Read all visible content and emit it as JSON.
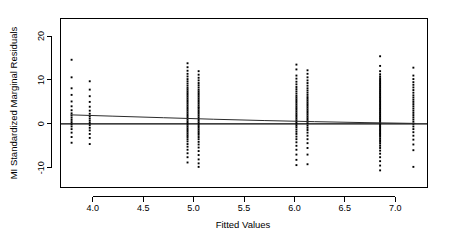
{
  "chart_data": {
    "type": "scatter",
    "title": "",
    "xlabel": "Fitted Values",
    "ylabel": "MI Standardized Marginal Residuals",
    "xlim": [
      3.68,
      7.32
    ],
    "ylim": [
      -14.5,
      24.0
    ],
    "xticks": [
      4.0,
      4.5,
      5.0,
      5.5,
      6.0,
      6.5,
      7.0
    ],
    "xtick_labels": [
      "4.0",
      "4.5",
      "5.0",
      "5.5",
      "6.0",
      "6.5",
      "7.0"
    ],
    "yticks": [
      -10,
      0,
      10,
      20
    ],
    "ytick_labels": [
      "-10",
      "0",
      "10",
      "20"
    ],
    "grid": false,
    "legend": "none",
    "point_marker": "filled-square",
    "point_color": "#000000",
    "clusters": [
      {
        "name": "cluster-3.79",
        "x": 3.79,
        "n": 18,
        "y_values": [
          14.6,
          10.6,
          8.1,
          6.6,
          5.1,
          4.0,
          3.1,
          2.4,
          1.9,
          1.4,
          0.9,
          0.4,
          -0.1,
          -0.6,
          -1.2,
          -2.0,
          -3.0,
          -4.3
        ]
      },
      {
        "name": "cluster-3.97",
        "x": 3.97,
        "n": 17,
        "y_values": [
          9.7,
          7.8,
          6.3,
          5.0,
          3.9,
          3.0,
          2.3,
          1.7,
          1.2,
          0.7,
          0.2,
          -0.3,
          -0.9,
          -1.5,
          -2.3,
          -3.2,
          -4.6
        ]
      },
      {
        "name": "cluster-4.94",
        "x": 4.94,
        "n": 46,
        "y_values": [
          13.8,
          12.9,
          12.1,
          11.4,
          10.8,
          10.2,
          9.7,
          9.2,
          8.7,
          8.2,
          7.8,
          7.4,
          7.0,
          6.6,
          6.2,
          5.8,
          5.4,
          5.0,
          4.6,
          4.2,
          3.8,
          3.4,
          3.0,
          2.6,
          2.2,
          1.8,
          1.4,
          1.0,
          0.6,
          0.2,
          -0.2,
          -0.6,
          -1.0,
          -1.4,
          -1.8,
          -2.2,
          -2.6,
          -3.0,
          -3.5,
          -4.0,
          -4.6,
          -5.2,
          -5.9,
          -6.7,
          -7.6,
          -8.8
        ]
      },
      {
        "name": "cluster-5.05",
        "x": 5.05,
        "n": 44,
        "y_values": [
          12.0,
          11.2,
          10.5,
          9.9,
          9.3,
          8.8,
          8.3,
          7.8,
          7.4,
          7.0,
          6.6,
          6.2,
          5.8,
          5.4,
          5.0,
          4.6,
          4.2,
          3.8,
          3.5,
          3.1,
          2.7,
          2.3,
          1.9,
          1.5,
          1.1,
          0.7,
          0.3,
          -0.1,
          -0.5,
          -0.9,
          -1.3,
          -1.7,
          -2.1,
          -2.5,
          -3.0,
          -3.5,
          -4.1,
          -4.7,
          -5.4,
          -6.2,
          -7.1,
          -8.1,
          -9.0,
          -9.8
        ]
      },
      {
        "name": "cluster-6.02",
        "x": 6.02,
        "n": 40,
        "y_values": [
          13.5,
          12.4,
          11.0,
          10.3,
          9.6,
          9.0,
          8.4,
          7.9,
          7.4,
          6.9,
          6.4,
          6.0,
          5.6,
          5.2,
          4.8,
          4.4,
          4.0,
          3.6,
          3.2,
          2.8,
          2.4,
          2.0,
          1.6,
          1.2,
          0.8,
          0.4,
          0.0,
          -0.4,
          -0.8,
          -1.3,
          -1.8,
          -2.3,
          -2.9,
          -3.5,
          -4.2,
          -5.0,
          -5.9,
          -7.0,
          -8.2,
          -9.4
        ]
      },
      {
        "name": "cluster-6.13",
        "x": 6.13,
        "n": 36,
        "y_values": [
          12.2,
          11.4,
          10.6,
          9.9,
          9.3,
          8.7,
          8.1,
          7.6,
          7.1,
          6.6,
          6.1,
          5.7,
          5.3,
          4.9,
          4.5,
          4.1,
          3.7,
          3.3,
          2.9,
          2.5,
          2.1,
          1.7,
          1.3,
          0.9,
          0.5,
          0.1,
          -0.4,
          -0.9,
          -1.4,
          -2.0,
          -2.7,
          -3.5,
          -4.4,
          -5.5,
          -7.0,
          -9.2
        ]
      },
      {
        "name": "cluster-6.85",
        "x": 6.85,
        "n": 62,
        "y_values": [
          15.4,
          13.2,
          12.0,
          11.3,
          10.8,
          10.4,
          10.0,
          9.7,
          9.4,
          9.1,
          8.8,
          8.5,
          8.2,
          7.9,
          7.6,
          7.3,
          7.0,
          6.7,
          6.4,
          6.1,
          5.8,
          5.5,
          5.2,
          4.9,
          4.6,
          4.3,
          4.0,
          3.7,
          3.4,
          3.1,
          2.8,
          2.5,
          2.2,
          1.9,
          1.6,
          1.3,
          1.0,
          0.7,
          0.4,
          0.1,
          -0.2,
          -0.5,
          -0.8,
          -1.1,
          -1.4,
          -1.7,
          -2.0,
          -2.3,
          -2.6,
          -2.9,
          -3.3,
          -3.7,
          -4.1,
          -4.5,
          -5.0,
          -5.5,
          -6.1,
          -6.8,
          -7.6,
          -8.5,
          -9.5,
          -10.6
        ]
      },
      {
        "name": "cluster-7.18",
        "x": 7.18,
        "n": 30,
        "y_values": [
          12.8,
          11.0,
          10.2,
          9.5,
          8.9,
          8.3,
          7.7,
          7.1,
          6.5,
          6.0,
          5.5,
          5.0,
          4.5,
          4.0,
          3.5,
          3.0,
          2.5,
          2.0,
          1.5,
          1.0,
          0.5,
          0.0,
          -0.6,
          -1.2,
          -1.9,
          -2.7,
          -3.6,
          -4.7,
          -6.0,
          -9.8
        ]
      }
    ],
    "lines": [
      {
        "name": "zero-reference-line",
        "style": "solid",
        "color": "#000000",
        "points": [
          [
            3.68,
            0.0
          ],
          [
            7.32,
            0.0
          ]
        ]
      },
      {
        "name": "loess-smooth-line",
        "style": "solid",
        "color": "#2b2b2b",
        "points": [
          [
            3.78,
            2.05
          ],
          [
            4.2,
            1.75
          ],
          [
            4.7,
            1.4
          ],
          [
            5.2,
            1.05
          ],
          [
            5.7,
            0.75
          ],
          [
            6.2,
            0.5
          ],
          [
            6.7,
            0.28
          ],
          [
            7.2,
            0.1
          ]
        ]
      }
    ]
  }
}
